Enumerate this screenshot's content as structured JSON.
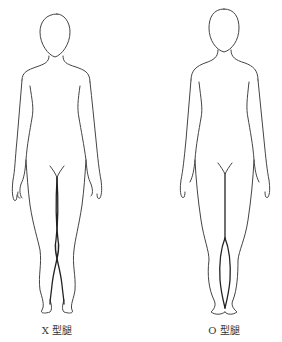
{
  "figures": [
    {
      "id": "x-legs",
      "label": "X 型腿",
      "description": "Front-view body outline illustrating knock knees"
    },
    {
      "id": "o-legs",
      "label": "O 型腿",
      "description": "Front-view body outline illustrating bow legs"
    }
  ],
  "colors": {
    "background": "#ffffff",
    "line": "#444444",
    "label": "#333333"
  }
}
